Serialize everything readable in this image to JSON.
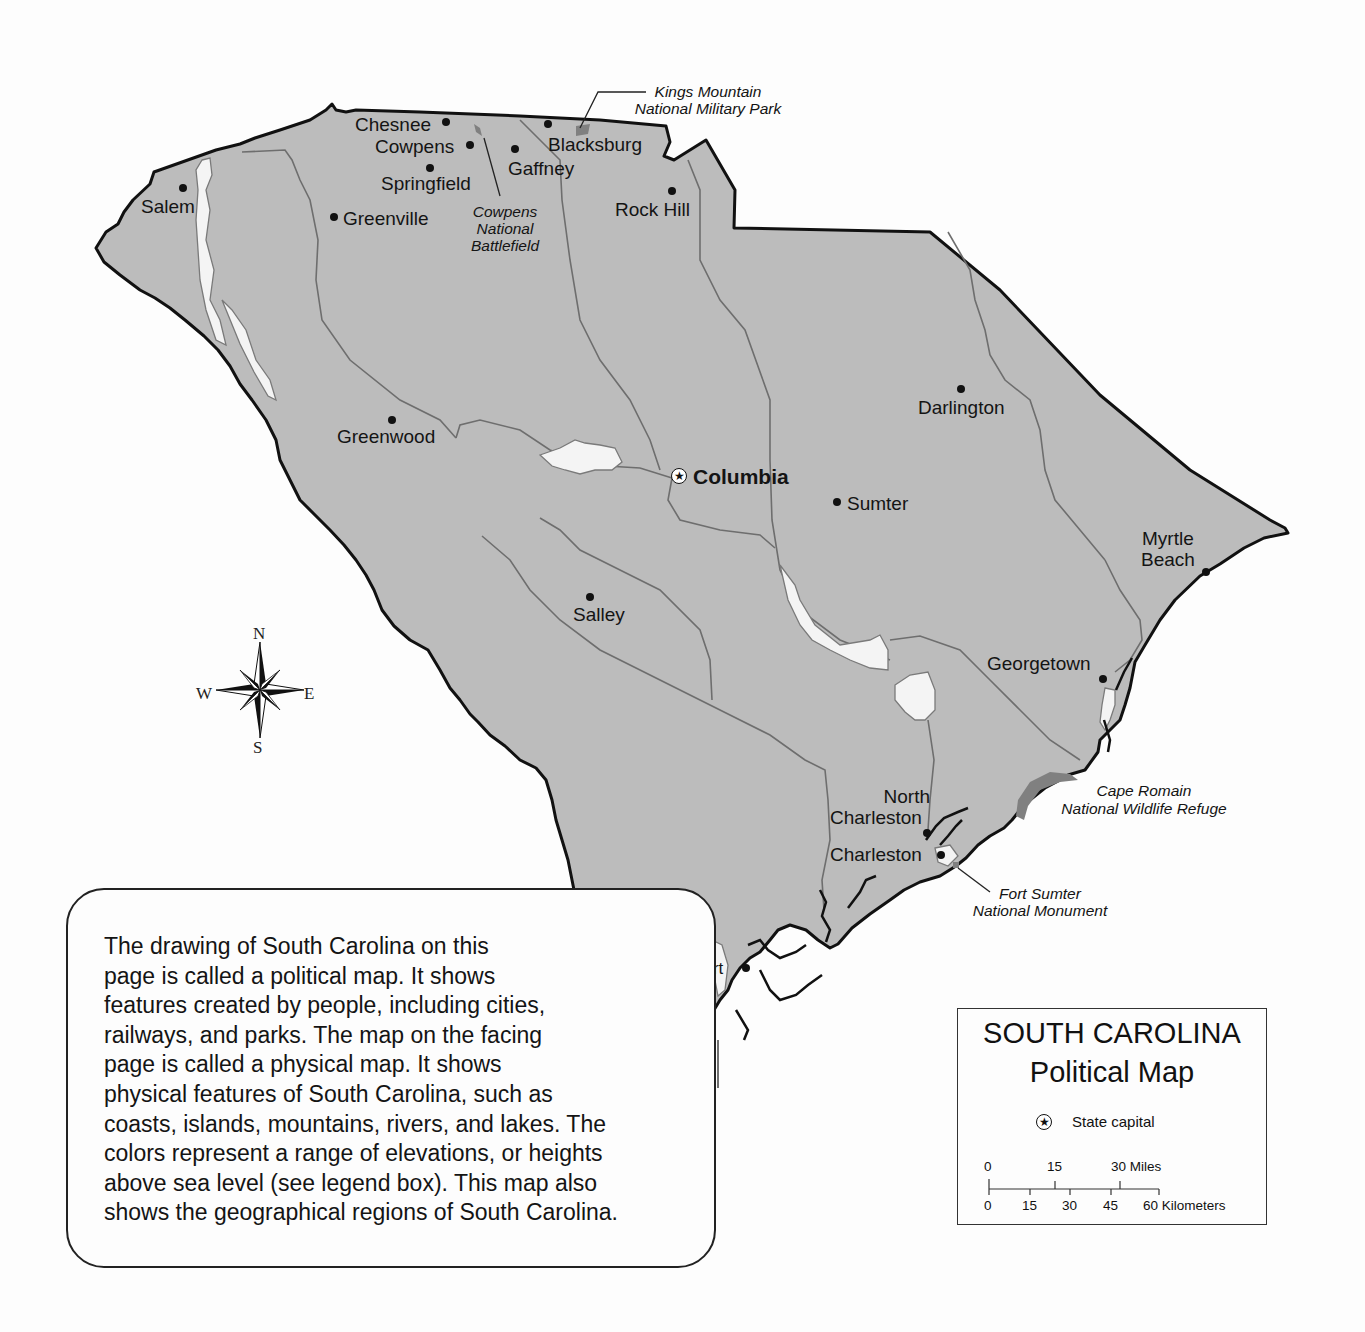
{
  "map": {
    "title": "SOUTH CAROLINA",
    "subtitle": "Political Map",
    "colors": {
      "land": "#bcbcbc",
      "background": "#fdfdfd",
      "border": "#111111",
      "river": "#6e6e6e",
      "lake": "#f4f4f4",
      "park": "#808080",
      "text": "#141414"
    },
    "capital": {
      "name": "Columbia"
    },
    "cities": [
      {
        "name": "Chesnee"
      },
      {
        "name": "Cowpens"
      },
      {
        "name": "Springfield"
      },
      {
        "name": "Salem"
      },
      {
        "name": "Greenville"
      },
      {
        "name": "Gaffney"
      },
      {
        "name": "Blacksburg"
      },
      {
        "name": "Rock Hill"
      },
      {
        "name": "Greenwood"
      },
      {
        "name": "Darlington"
      },
      {
        "name": "Sumter"
      },
      {
        "name": "Salley"
      },
      {
        "name": "Myrtle Beach"
      },
      {
        "name": "Georgetown"
      },
      {
        "name": "North Charleston"
      },
      {
        "name": "Charleston"
      },
      {
        "name": "Beaufort"
      }
    ],
    "label_lines": {
      "myrtle_1": "Myrtle",
      "myrtle_2": "Beach",
      "north_charleston_1": "North",
      "north_charleston_2": "Charleston"
    },
    "parks": {
      "kings_mountain_1": "Kings Mountain",
      "kings_mountain_2": "National Military Park",
      "cowpens_1": "Cowpens",
      "cowpens_2": "National",
      "cowpens_3": "Battlefield",
      "cape_romain_1": "Cape Romain",
      "cape_romain_2": "National Wildlife Refuge",
      "fort_sumter_1": "Fort Sumter",
      "fort_sumter_2": "National Monument"
    },
    "compass": {
      "north": "N",
      "south": "S",
      "east": "E",
      "west": "W"
    }
  },
  "legend": {
    "title": "SOUTH CAROLINA",
    "subtitle": "Political Map",
    "capital_symbol": "★",
    "capital_label": "State capital",
    "scale": {
      "miles_ticks": [
        "0",
        "15",
        "30 Miles"
      ],
      "km_ticks": [
        "0",
        "15",
        "30",
        "45",
        "60 Kilometers"
      ]
    }
  },
  "description": {
    "text": "The drawing of South Carolina on this page is called a political map.  It shows features created by people, including cities, railways, and parks.  The map on the facing page is called a physical map.  It shows physical features of South Carolina, such as coasts, islands, mountains, rivers, and lakes.  The colors represent a range of elevations, or heights above sea level (see legend box).  This map also shows the geographical regions of South Carolina.",
    "lines": [
      "The drawing of South Carolina on this",
      "page is called a political map.  It shows",
      "features created by people, including cities,",
      "railways, and parks.  The map on the facing",
      "page is called a physical map.  It shows",
      "physical features of South Carolina, such as",
      "coasts, islands, mountains, rivers, and lakes.  The",
      "colors represent a range of elevations, or heights",
      "above sea level (see legend box).  This map also",
      "shows the geographical regions of South Carolina."
    ]
  }
}
